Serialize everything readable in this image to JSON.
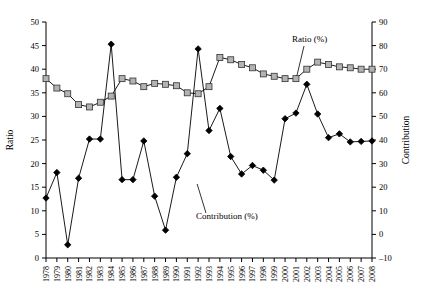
{
  "chart_data": {
    "type": "line",
    "title": "",
    "subtitle": "",
    "xlabel": "",
    "ylabel": "Ratio",
    "y2label": "Contribution",
    "ylim": [
      0,
      50
    ],
    "y2lim": [
      -10,
      90
    ],
    "ytick_step": 5,
    "y2tick_step": 10,
    "grid": false,
    "legend_position": "inline-annotations",
    "yticks": [
      "0",
      "5",
      "10",
      "15",
      "20",
      "25",
      "30",
      "35",
      "40",
      "45",
      "50"
    ],
    "y2ticks": [
      "-10",
      "0",
      "10",
      "20",
      "30",
      "40",
      "50",
      "60",
      "70",
      "80",
      "90"
    ],
    "categories": [
      "1978",
      "1979",
      "1980",
      "1981",
      "1982",
      "1983",
      "1984",
      "1985",
      "1986",
      "1987",
      "1988",
      "1989",
      "1990",
      "1991",
      "1992",
      "1993",
      "1994",
      "1995",
      "1996",
      "1997",
      "1998",
      "1999",
      "2000",
      "2001",
      "2002",
      "2003",
      "2004",
      "2005",
      "2006",
      "2007",
      "2008"
    ],
    "series": [
      {
        "name": "Ratio (%)",
        "axis": "left",
        "marker": "square",
        "marker_fill": "#b3b3b3",
        "marker_stroke": "#333333",
        "line_color": "#555555",
        "values": [
          38,
          36,
          34.8,
          32.5,
          32,
          33,
          34.3,
          38,
          37.5,
          36.3,
          37,
          36.8,
          36.5,
          35,
          34.8,
          36.3,
          42.5,
          42,
          41,
          40.3,
          39,
          38.5,
          38,
          38,
          40,
          41.5,
          41,
          40.5,
          40.3,
          40,
          40
        ]
      },
      {
        "name": "Contribution (%)",
        "axis": "right",
        "marker": "diamond",
        "marker_fill": "#000000",
        "marker_stroke": "#000000",
        "line_color": "#000000",
        "values": [
          15.4,
          26.2,
          -4.4,
          23.8,
          40.4,
          40.4,
          80.6,
          23.2,
          23.2,
          39.6,
          16.2,
          1.8,
          24.2,
          34.2,
          78.6,
          44,
          53.4,
          33,
          25.6,
          29.2,
          27.2,
          23,
          49,
          51.4,
          63.6,
          51,
          41,
          42.6,
          39.2,
          39.4,
          39.6
        ]
      }
    ],
    "annotations": [
      {
        "text": "Ratio (%)",
        "target_category": "2001",
        "id": "ratio-annotation"
      },
      {
        "text": "Contribution (%)",
        "target_category": "1992",
        "id": "contribution-annotation"
      }
    ]
  }
}
